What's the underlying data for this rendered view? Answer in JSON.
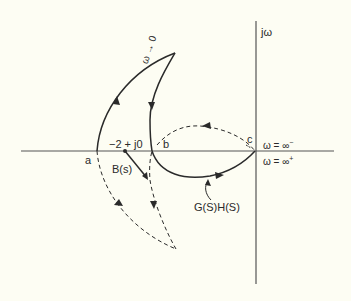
{
  "diagram": {
    "type": "Nyquist / polar plot",
    "axes": {
      "imaginary_label": "jω",
      "real_axis": "horizontal",
      "imaginary_axis": "vertical"
    },
    "points": {
      "a": "a",
      "b": "b",
      "c": "c",
      "critical_point": "−2 + j0"
    },
    "labels": {
      "omega_to_zero": "ω → 0",
      "omega_inf_minus": "ω = ∞",
      "omega_inf_minus_sup": "−",
      "omega_inf_plus": "ω = ∞",
      "omega_inf_plus_sup": "+",
      "b_of_s": "B(s)",
      "gh": "G(S)H(S)"
    },
    "curves": [
      {
        "name": "G(S)H(S) locus (positive ω)",
        "style": "solid"
      },
      {
        "name": "mirror locus (negative ω)",
        "style": "dashed"
      },
      {
        "name": "B(s) vector from −2+j0",
        "style": "solid arrow"
      }
    ],
    "colors": {
      "background": "#fdfdf3",
      "ink": "#2a2a2a",
      "axis": "#555555"
    }
  }
}
